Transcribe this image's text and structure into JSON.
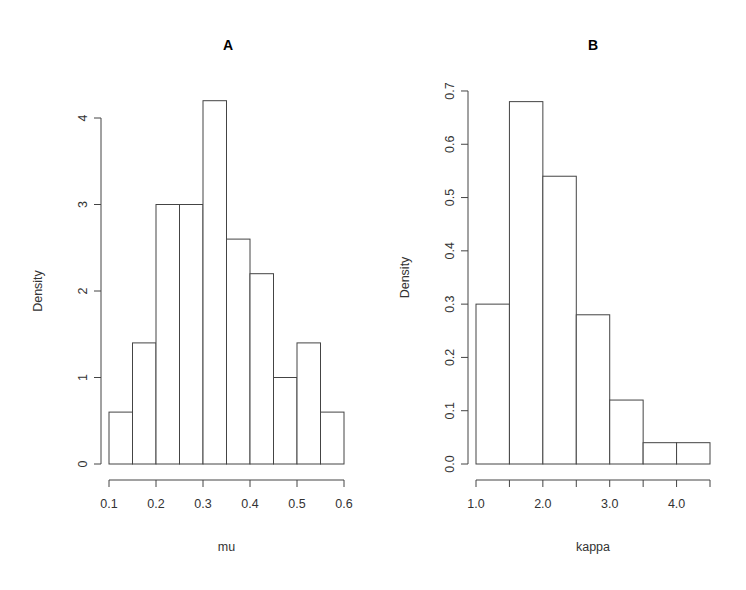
{
  "chart_data": [
    {
      "type": "bar",
      "subtype": "histogram",
      "title": "A",
      "xlabel": "mu",
      "ylabel": "Density",
      "bin_edges": [
        0.1,
        0.15,
        0.2,
        0.25,
        0.3,
        0.35,
        0.4,
        0.45,
        0.5,
        0.55,
        0.6
      ],
      "values": [
        0.6,
        1.4,
        3.0,
        3.0,
        4.2,
        2.6,
        2.2,
        1.0,
        1.4,
        0.6
      ],
      "xlim": [
        0.1,
        0.6
      ],
      "ylim": [
        0,
        4.2
      ],
      "x_ticks": [
        0.1,
        0.2,
        0.3,
        0.4,
        0.5,
        0.6
      ],
      "x_tick_labels": [
        "0.1",
        "0.2",
        "0.3",
        "0.4",
        "0.5",
        "0.6"
      ],
      "x_minor_ticks": [],
      "y_ticks": [
        0,
        1,
        2,
        3,
        4
      ],
      "y_tick_labels": [
        "0",
        "1",
        "2",
        "3",
        "4"
      ],
      "grid": false,
      "legend": null
    },
    {
      "type": "bar",
      "subtype": "histogram",
      "title": "B",
      "xlabel": "kappa",
      "ylabel": "Density",
      "bin_edges": [
        1.0,
        1.5,
        2.0,
        2.5,
        3.0,
        3.5,
        4.0,
        4.5
      ],
      "values": [
        0.3,
        0.68,
        0.54,
        0.28,
        0.12,
        0.04,
        0.04
      ],
      "xlim": [
        1.0,
        4.5
      ],
      "ylim": [
        0,
        0.7
      ],
      "x_ticks": [
        1.0,
        1.5,
        2.0,
        2.5,
        3.0,
        3.5,
        4.0,
        4.5
      ],
      "x_tick_labels": [
        "1.0",
        "",
        "2.0",
        "",
        "3.0",
        "",
        "4.0",
        ""
      ],
      "y_ticks": [
        0.0,
        0.1,
        0.2,
        0.3,
        0.4,
        0.5,
        0.6,
        0.7
      ],
      "y_tick_labels": [
        "0.0",
        "0.1",
        "0.2",
        "0.3",
        "0.4",
        "0.5",
        "0.6",
        "0.7"
      ],
      "grid": false,
      "legend": null
    }
  ],
  "layout": [
    {
      "x0_px": 109,
      "x1_px": 344,
      "y0_px": 464,
      "y_px_per_unit": 86.5,
      "yaxis_x_px": 101,
      "xaxis_y_px": 480,
      "title_x_px": 228,
      "title_y_px": 50,
      "ylabel_x_px": 42,
      "xlabel_y_px": 551
    },
    {
      "x0_px": 476,
      "x1_px": 710,
      "y0_px": 464,
      "y_px_per_unit": 532.9,
      "yaxis_x_px": 468,
      "xaxis_y_px": 480,
      "title_x_px": 593,
      "title_y_px": 50,
      "ylabel_x_px": 409,
      "xlabel_y_px": 551
    }
  ]
}
